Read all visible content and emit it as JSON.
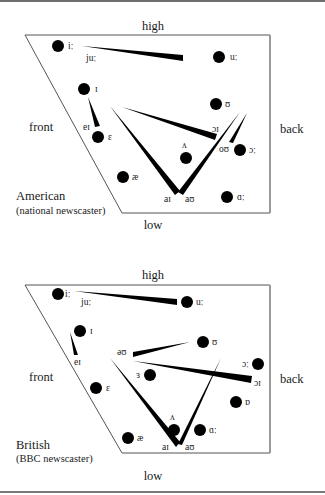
{
  "figure": {
    "charts": [
      {
        "id": "american",
        "caption_line1": "American",
        "caption_line2": "(national newscaster)",
        "axis_labels": {
          "top": "high",
          "bottom": "low",
          "left": "front",
          "right": "back"
        },
        "monophthongs": [
          {
            "symbol": "iː",
            "x": 58,
            "y": 46
          },
          {
            "symbol": "uː",
            "x": 219,
            "y": 57
          },
          {
            "symbol": "ɪ",
            "x": 84,
            "y": 89
          },
          {
            "symbol": "ʊ",
            "x": 216,
            "y": 104
          },
          {
            "symbol": "ɛ",
            "x": 98,
            "y": 137
          },
          {
            "symbol": "ʌ",
            "x": 186,
            "y": 158
          },
          {
            "symbol": "ɔː",
            "x": 240,
            "y": 150
          },
          {
            "symbol": "æ",
            "x": 123,
            "y": 177
          },
          {
            "symbol": "ɑː",
            "x": 227,
            "y": 197
          }
        ],
        "diphthongs": [
          {
            "label": "juː",
            "lx": 86,
            "ly": 61
          },
          {
            "label": "eɪ",
            "lx": 83,
            "ly": 130
          },
          {
            "label": "ɔɪ",
            "lx": 212,
            "ly": 132
          },
          {
            "label": "oʊ",
            "lx": 221,
            "ly": 151
          },
          {
            "label": "aɪ",
            "lx": 164,
            "ly": 202
          },
          {
            "label": "aʊ",
            "lx": 185,
            "ly": 202
          }
        ]
      },
      {
        "id": "british",
        "caption_line1": "British",
        "caption_line2": "(BBC newscaster)",
        "axis_labels": {
          "top": "high",
          "bottom": "low",
          "left": "front",
          "right": "back"
        },
        "monophthongs": [
          {
            "symbol": "iː",
            "x": 58,
            "y": 294
          },
          {
            "symbol": "uː",
            "x": 187,
            "y": 302
          },
          {
            "symbol": "ɪ",
            "x": 80,
            "y": 331
          },
          {
            "symbol": "ʊ",
            "x": 203,
            "y": 342
          },
          {
            "symbol": "ɔː",
            "x": 258,
            "y": 364
          },
          {
            "symbol": "ɜ",
            "x": 150,
            "y": 375
          },
          {
            "symbol": "ɛ",
            "x": 96,
            "y": 388
          },
          {
            "symbol": "ɒ",
            "x": 236,
            "y": 402
          },
          {
            "symbol": "ʌ",
            "x": 174,
            "y": 430
          },
          {
            "symbol": "ɑː",
            "x": 200,
            "y": 430
          },
          {
            "symbol": "æ",
            "x": 128,
            "y": 438
          }
        ],
        "diphthongs": [
          {
            "label": "juː",
            "lx": 81,
            "ly": 305
          },
          {
            "label": "eɪ",
            "lx": 74,
            "ly": 365
          },
          {
            "label": "əʊ",
            "lx": 118,
            "ly": 354
          },
          {
            "label": "ɔɪ",
            "lx": 256,
            "ly": 384
          },
          {
            "label": "aɪ",
            "lx": 162,
            "ly": 449
          },
          {
            "label": "aʊ",
            "lx": 185,
            "ly": 449
          }
        ]
      }
    ]
  }
}
